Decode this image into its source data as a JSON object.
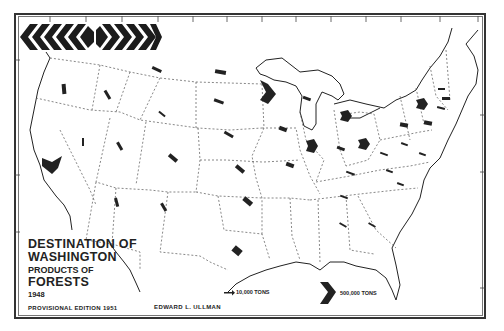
{
  "map": {
    "title_line1": "DESTINATION OF",
    "title_line2": "WASHINGTON",
    "title_line3": "PRODUCTS OF",
    "title_line4": "FORESTS",
    "year": "1948",
    "edition": "PROVISIONAL EDITION 1951",
    "author": "EDWARD L. ULLMAN"
  },
  "legend": {
    "small_label": "10,000 TONS",
    "large_label": "500,000 TONS"
  },
  "colors": {
    "ink": "#222222",
    "border": "#333333",
    "paper": "#ffffff"
  }
}
